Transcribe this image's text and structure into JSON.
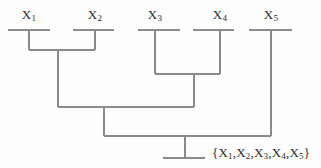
{
  "figure": {
    "type": "dendrogram",
    "title": "",
    "background_color": "#fdfdfd",
    "line_color": "#8a8a8a",
    "text_color": "#2b2b2b"
  },
  "leaves": [
    {
      "id": "x1",
      "label": "X",
      "subscript": "1",
      "x": 29,
      "bar_left": 8,
      "bar_right": 50,
      "bar_y": 30
    },
    {
      "id": "x2",
      "label": "X",
      "subscript": "2",
      "x": 95,
      "bar_left": 73,
      "bar_right": 114,
      "bar_y": 30
    },
    {
      "id": "x3",
      "label": "X",
      "subscript": "3",
      "x": 155,
      "bar_left": 138,
      "bar_right": 180,
      "bar_y": 30
    },
    {
      "id": "x4",
      "label": "X",
      "subscript": "4",
      "x": 220,
      "bar_left": 193,
      "bar_right": 234,
      "bar_y": 30
    },
    {
      "id": "x5",
      "label": "X",
      "subscript": "5",
      "x": 271,
      "bar_left": 249,
      "bar_right": 292,
      "bar_y": 30
    }
  ],
  "merges": [
    {
      "id": "merge-x1-x2",
      "members": "{X1,X2}",
      "bar_y": 50,
      "bar_left": 29,
      "bar_right": 95,
      "stem_x": 58,
      "stem_to_y": 107
    },
    {
      "id": "merge-x3-x4",
      "members": "{X3,X4}",
      "bar_y": 74,
      "bar_left": 155,
      "bar_right": 220,
      "stem_x": 194,
      "stem_to_y": 107
    },
    {
      "id": "merge-x1x2-x3x4",
      "members": "{X1,X2,X3,X4}",
      "bar_y": 107,
      "bar_left": 58,
      "bar_right": 194,
      "stem_x": 104,
      "stem_to_y": 136
    },
    {
      "id": "merge-root",
      "members": "{X1,X2,X3,X4,X5}",
      "bar_y": 136,
      "bar_left": 104,
      "bar_right": 271,
      "stem_x": 185,
      "stem_to_y": 158
    }
  ],
  "root": {
    "base_bar_y": 158,
    "base_bar_left": 163,
    "base_bar_right": 205,
    "set_label": "{X",
    "set_label_full": "{X1,X2,X3,X4,X5}",
    "set_label_x": 212,
    "set_label_y": 145,
    "set_items": [
      {
        "label": "X",
        "subscript": "1"
      },
      {
        "label": "X",
        "subscript": "2"
      },
      {
        "label": "X",
        "subscript": "3"
      },
      {
        "label": "X",
        "subscript": "4"
      },
      {
        "label": "X",
        "subscript": "5"
      }
    ],
    "brace_open": "{",
    "brace_close": "}",
    "separator": ","
  }
}
